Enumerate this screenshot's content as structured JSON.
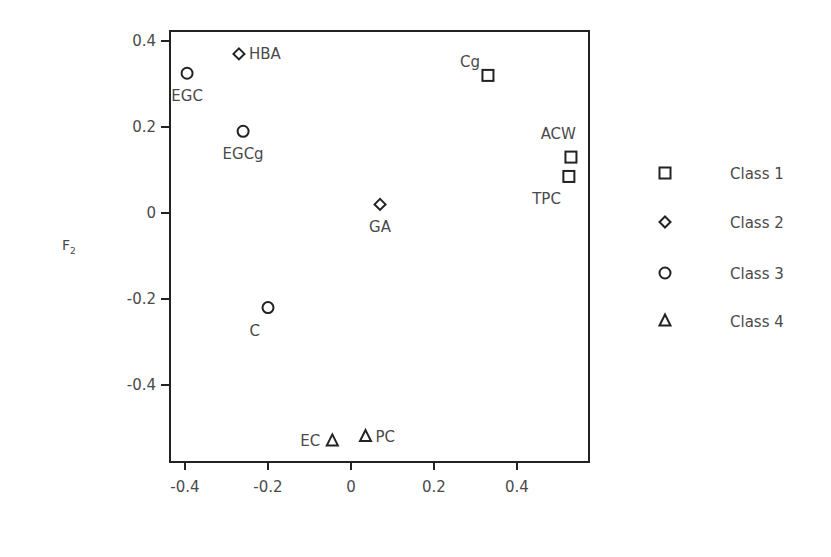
{
  "chart_data": {
    "type": "scatter",
    "title": "",
    "xlabel": "",
    "ylabel": "F2",
    "ylabel_main": "F",
    "ylabel_sub": "2",
    "xlim": [
      -0.44,
      0.57
    ],
    "ylim": [
      -0.575,
      0.42
    ],
    "xticks": [
      -0.4,
      -0.2,
      0,
      0.2,
      0.4
    ],
    "xtick_labels": [
      "-0.4",
      "-0.2",
      "0",
      "0.2",
      "0.4"
    ],
    "yticks": [
      0.4,
      0.2,
      0,
      -0.2,
      -0.4
    ],
    "ytick_labels": [
      "0.4",
      "0.2",
      "0",
      "-0.2",
      "-0.4"
    ],
    "grid": false,
    "legend_position": "right",
    "series": [
      {
        "name": "Class 1",
        "marker": "square",
        "points": [
          {
            "label": "Cg",
            "x": 0.33,
            "y": 0.32,
            "label_pos": "upper-left"
          },
          {
            "label": "ACW",
            "x": 0.53,
            "y": 0.13,
            "label_pos": "above-left"
          },
          {
            "label": "TPC",
            "x": 0.525,
            "y": 0.085,
            "label_pos": "below-left"
          }
        ]
      },
      {
        "name": "Class 2",
        "marker": "diamond",
        "points": [
          {
            "label": "HBA",
            "x": -0.27,
            "y": 0.37,
            "label_pos": "right"
          },
          {
            "label": "GA",
            "x": 0.07,
            "y": 0.02,
            "label_pos": "below"
          }
        ]
      },
      {
        "name": "Class 3",
        "marker": "circle",
        "points": [
          {
            "label": "EGC",
            "x": -0.395,
            "y": 0.325,
            "label_pos": "below"
          },
          {
            "label": "EGCg",
            "x": -0.26,
            "y": 0.19,
            "label_pos": "below"
          },
          {
            "label": "C",
            "x": -0.2,
            "y": -0.22,
            "label_pos": "below-left"
          }
        ]
      },
      {
        "name": "Class 4",
        "marker": "triangle",
        "points": [
          {
            "label": "EC",
            "x": -0.045,
            "y": -0.53,
            "label_pos": "left"
          },
          {
            "label": "PC",
            "x": 0.035,
            "y": -0.52,
            "label_pos": "right"
          }
        ]
      }
    ]
  },
  "legend": {
    "items": [
      {
        "label": "Class 1",
        "marker": "square"
      },
      {
        "label": "Class 2",
        "marker": "diamond"
      },
      {
        "label": "Class 3",
        "marker": "circle"
      },
      {
        "label": "Class 4",
        "marker": "triangle"
      }
    ]
  },
  "colors": {
    "marker_stroke": "#222222",
    "axis": "#222222",
    "text": "#4a4a4a"
  }
}
